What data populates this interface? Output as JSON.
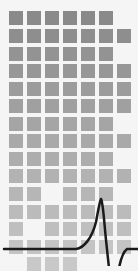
{
  "graphic": {
    "description": "Grid of gray squares fading from dark (top) to light (bottom) with a black pulse waveform line across the lower portion",
    "background": "#f5f5f5",
    "grid": {
      "columns": 7,
      "rows": 15,
      "col_x": [
        9,
        27,
        45,
        63,
        81,
        99,
        117
      ],
      "row_y": [
        11,
        29,
        47,
        64,
        82,
        99,
        117,
        134,
        152,
        169,
        187,
        205,
        222,
        240,
        257
      ],
      "cell_size": 14,
      "color_top": "#8a8a8a",
      "color_bottom": "#c8c8c8",
      "pattern": [
        "1111110",
        "1111111",
        "1111110",
        "1111111",
        "1111111",
        "1111111",
        "1111110",
        "1111111",
        "1111110",
        "1111111",
        "1101110",
        "1111111",
        "1011111",
        "1111111",
        "0111000"
      ]
    },
    "waveform": {
      "color": "#1a1a1a",
      "stroke_width": 2.5,
      "path": "M4 249 L76 249 C84 248 92 238 96 222 C98 212 99 204 101 199 C103 202 104 220 106 240 L109 268 M119 268 C121 258 123 252 127 249 L138 249"
    }
  }
}
